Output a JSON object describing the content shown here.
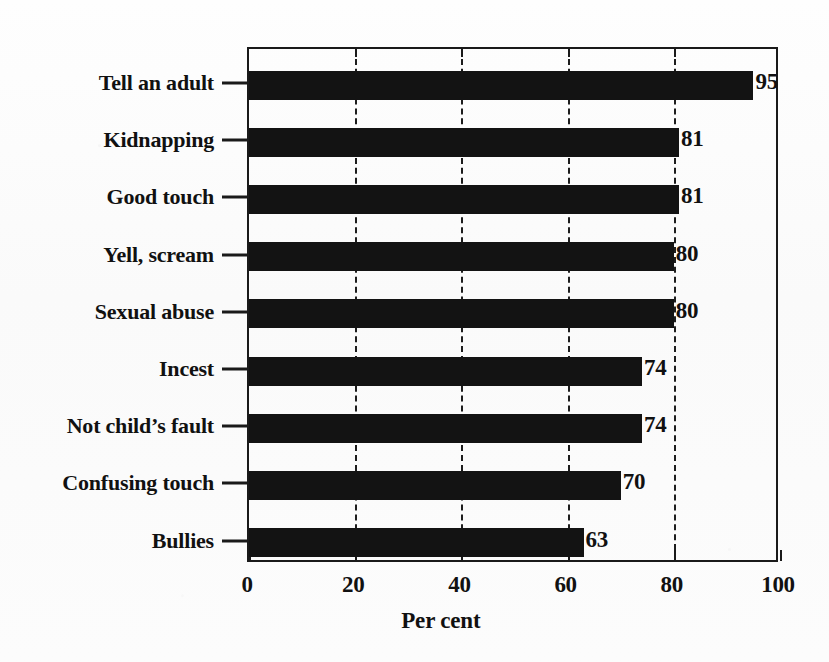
{
  "chart_data": {
    "type": "bar",
    "orientation": "horizontal",
    "title": "",
    "xlabel": "Per cent",
    "ylabel": "",
    "xlim": [
      0,
      100
    ],
    "xticks": [
      0,
      20,
      40,
      60,
      80,
      100
    ],
    "xtick_labels": [
      "0",
      "20",
      "40",
      "60",
      "80",
      "100"
    ],
    "grid": "vertical dashed gridlines at 20, 40, 60, 80",
    "legend": "none",
    "bar_color": "#131313",
    "categories": [
      "Tell an adult",
      "Kidnapping",
      "Good touch",
      "Yell, scream",
      "Sexual abuse",
      "Incest",
      "Not child’s fault",
      "Confusing touch",
      "Bullies"
    ],
    "values": [
      95,
      81,
      81,
      80,
      80,
      74,
      74,
      70,
      63
    ],
    "value_labels": [
      "95",
      "81",
      "81",
      "80",
      "80",
      "74",
      "74",
      "70",
      "63"
    ]
  }
}
